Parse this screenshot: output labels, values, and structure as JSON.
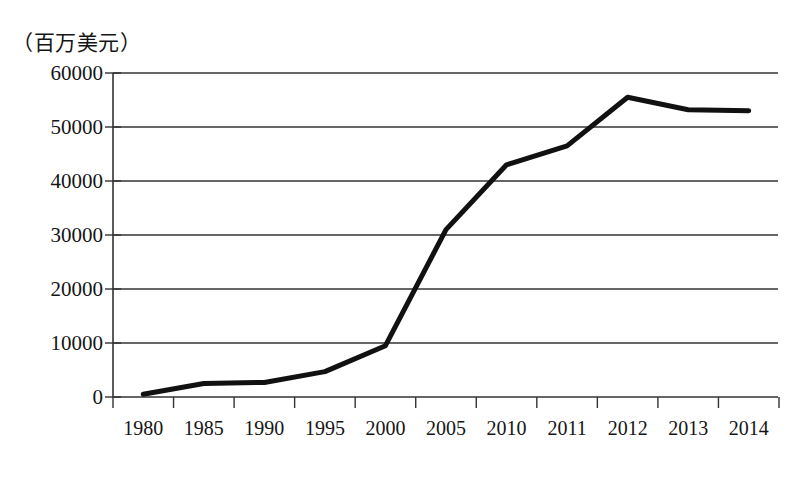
{
  "chart_data": {
    "type": "line",
    "title": "",
    "subtitle": "",
    "unit_label": "（百万美元）",
    "xlabel": "",
    "ylabel": "",
    "categories": [
      "1980",
      "1985",
      "1990",
      "1995",
      "2000",
      "2005",
      "2010",
      "2011",
      "2012",
      "2013",
      "2014"
    ],
    "values": [
      500,
      2500,
      2700,
      4700,
      9500,
      31000,
      43000,
      46500,
      55500,
      53200,
      53000
    ],
    "series": [
      {
        "name": "",
        "values": [
          500,
          2500,
          2700,
          4700,
          9500,
          31000,
          43000,
          46500,
          55500,
          53200,
          53000
        ]
      }
    ],
    "ylim": [
      0,
      60000
    ],
    "ytick_labels": [
      "0",
      "10000",
      "20000",
      "30000",
      "40000",
      "50000",
      "60000"
    ],
    "ytick_values": [
      0,
      10000,
      20000,
      30000,
      40000,
      50000,
      60000
    ],
    "grid": "horizontal",
    "legend": "none",
    "line_color": "#111111",
    "line_width": 5,
    "axis_color": "#333333",
    "background_color": "#ffffff"
  }
}
